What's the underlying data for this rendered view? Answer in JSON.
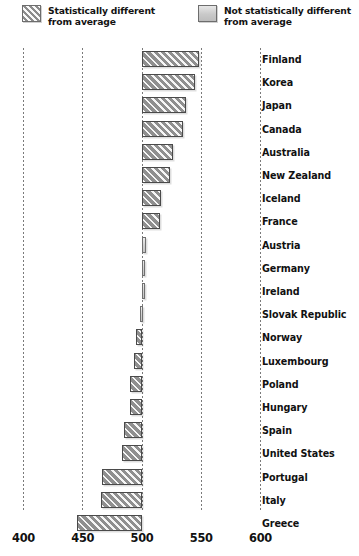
{
  "legend": {
    "items": [
      {
        "key": "significant",
        "pattern": "hatched",
        "label": "Statistically different\nfrom average"
      },
      {
        "key": "not_significant",
        "pattern": "solid",
        "label": "Not statistically different\nfrom average"
      }
    ]
  },
  "axis": {
    "ticks": [
      400,
      450,
      500,
      550,
      600
    ],
    "tick_labels": [
      "400",
      "450",
      "500",
      "550",
      "600"
    ],
    "min": 400,
    "max": 600,
    "baseline": 500
  },
  "colors": {
    "hatch_fill": "#8f8f8f",
    "solid_fill": "#d2d2d2",
    "bar_border": "#4a4a4a",
    "gridline": "#7a7a7a",
    "text": "#111111",
    "background": "#ffffff"
  },
  "chart_data": {
    "type": "bar",
    "orientation": "horizontal",
    "title": "",
    "xlabel": "",
    "ylabel": "",
    "xlim": [
      400,
      600
    ],
    "baseline": 500,
    "grid": true,
    "gridlines_at": [
      400,
      450,
      500,
      550,
      600
    ],
    "legend_position": "top",
    "categories": [
      "Finland",
      "Korea",
      "Japan",
      "Canada",
      "Australia",
      "New Zealand",
      "Iceland",
      "France",
      "Austria",
      "Germany",
      "Ireland",
      "Slovak Republic",
      "Norway",
      "Luxembourg",
      "Poland",
      "Hungary",
      "Spain",
      "United States",
      "Portugal",
      "Italy",
      "Greece"
    ],
    "values": [
      548,
      545,
      537,
      535,
      526,
      524,
      516,
      515,
      503,
      502,
      502,
      498,
      495,
      493,
      490,
      490,
      485,
      483,
      466,
      465,
      445
    ],
    "significance": [
      "significant",
      "significant",
      "significant",
      "significant",
      "significant",
      "significant",
      "significant",
      "significant",
      "not_significant",
      "not_significant",
      "not_significant",
      "not_significant",
      "significant",
      "significant",
      "significant",
      "significant",
      "significant",
      "significant",
      "significant",
      "significant",
      "significant"
    ]
  }
}
